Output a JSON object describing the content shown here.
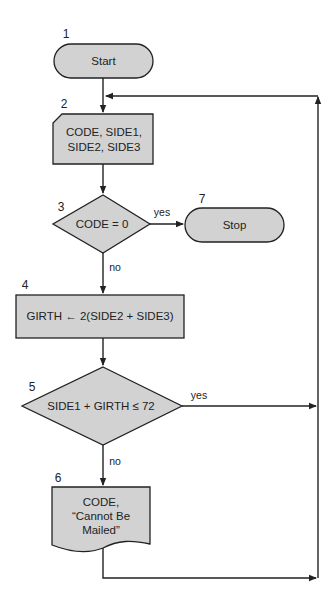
{
  "diagram": {
    "type": "flowchart",
    "nodes": [
      {
        "id": "1",
        "number": "1",
        "shape": "terminal",
        "lines": [
          "Start"
        ]
      },
      {
        "id": "2",
        "number": "2",
        "shape": "card-input",
        "lines": [
          "CODE, SIDE1,",
          "SIDE2, SIDE3"
        ]
      },
      {
        "id": "3",
        "number": "3",
        "shape": "decision",
        "lines": [
          "CODE = 0"
        ]
      },
      {
        "id": "4",
        "number": "4",
        "shape": "process",
        "lines": [
          "GIRTH ← 2(SIDE2 + SIDE3)"
        ]
      },
      {
        "id": "5",
        "number": "5",
        "shape": "decision",
        "lines": [
          "SIDE1 + GIRTH ≤ 72"
        ]
      },
      {
        "id": "6",
        "number": "6",
        "shape": "document-output",
        "lines": [
          "CODE,",
          "“Cannot Be",
          "Mailed”"
        ]
      },
      {
        "id": "7",
        "number": "7",
        "shape": "terminal",
        "lines": [
          "Stop"
        ]
      }
    ],
    "edges": [
      {
        "from": "1",
        "to": "2",
        "label": ""
      },
      {
        "from": "2",
        "to": "3",
        "label": ""
      },
      {
        "from": "3",
        "to": "7",
        "label": "yes"
      },
      {
        "from": "3",
        "to": "4",
        "label": "no"
      },
      {
        "from": "4",
        "to": "5",
        "label": ""
      },
      {
        "from": "5",
        "to": "2",
        "label": "yes"
      },
      {
        "from": "5",
        "to": "6",
        "label": "no"
      },
      {
        "from": "6",
        "to": "2",
        "label": ""
      }
    ],
    "edge_labels": {
      "yes3": "yes",
      "no3": "no",
      "yes5": "yes",
      "no5": "no"
    },
    "colors": {
      "shape_fill": "#d2d2d2",
      "stroke": "#222222",
      "background": "#ffffff"
    }
  }
}
